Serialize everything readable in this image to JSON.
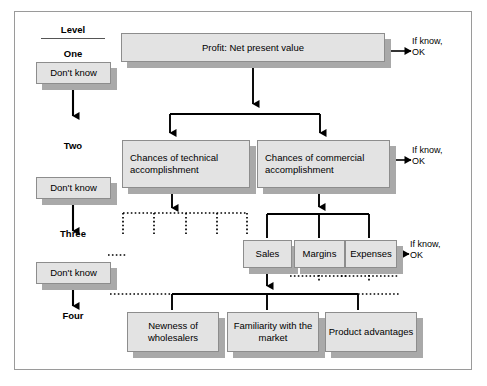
{
  "diagram": {
    "colors": {
      "box_fill": "#e3e3e3",
      "box_border": "#8d8d8d",
      "box_shadow": "#a9a9a9",
      "frame_border": "#9a9a9a",
      "solid_line": "#000000",
      "dotted_line": "#000000",
      "background": "#ffffff"
    },
    "level_column": {
      "header": "Level",
      "levels": [
        {
          "name": "One"
        },
        {
          "name": "Two"
        },
        {
          "name": "Three"
        },
        {
          "name": "Four"
        }
      ],
      "dont_know_label": "Don't know",
      "dont_know_count": 3
    },
    "nodes": {
      "profit": "Profit: Net present value",
      "technical": "Chances of technical accomplishment",
      "commercial": "Chances of commercial accomplishment",
      "sales": "Sales",
      "margins": "Margins",
      "expenses": "Expenses",
      "newness": "Newness of wholesalers",
      "familiarity": "Familiarity with the market",
      "product": "Product advantages"
    },
    "annotations": {
      "if_know_line1": "If know,",
      "if_know_line2": "OK",
      "if_know_count": 3
    }
  }
}
